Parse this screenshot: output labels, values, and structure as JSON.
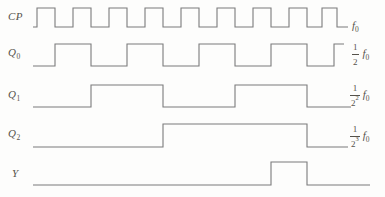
{
  "figure_type": "timing-diagram",
  "colors": {
    "background": "#fdfdfc",
    "line": "#7b7b7b",
    "text": "#55524b"
  },
  "signals": [
    {
      "id": "cp",
      "name": "CP",
      "sub": "",
      "x_start": 33,
      "x_end": 348,
      "initial_level": "low",
      "toggles": [
        37,
        55,
        73,
        91,
        109,
        127,
        145,
        163,
        181,
        199,
        217,
        235,
        253,
        271,
        289,
        307,
        322,
        337
      ]
    },
    {
      "id": "q0",
      "name": "Q",
      "sub": "0",
      "x_start": 33,
      "x_end": 344,
      "initial_level": "low",
      "toggles": [
        55,
        91,
        127,
        163,
        199,
        235,
        271,
        307,
        334
      ]
    },
    {
      "id": "q1",
      "name": "Q",
      "sub": "1",
      "x_start": 33,
      "x_end": 351,
      "initial_level": "low",
      "toggles": [
        91,
        163,
        235,
        307
      ]
    },
    {
      "id": "q2",
      "name": "Q",
      "sub": "2",
      "x_start": 33,
      "x_end": 348,
      "initial_level": "low",
      "toggles": [
        163,
        307
      ]
    },
    {
      "id": "y",
      "name": "Y",
      "sub": "",
      "x_start": 33,
      "x_end": 370,
      "initial_level": "low",
      "toggles": [
        271,
        307
      ]
    }
  ],
  "right_labels": [
    {
      "kind": "plain",
      "num": "",
      "den": "",
      "exp": "",
      "f": "f",
      "fsub": "0"
    },
    {
      "kind": "fraction",
      "num": "1",
      "den": "2",
      "exp": "",
      "f": "f",
      "fsub": "0"
    },
    {
      "kind": "fraction",
      "num": "1",
      "den": "2",
      "exp": "2",
      "f": "f",
      "fsub": "0"
    },
    {
      "kind": "fraction",
      "num": "1",
      "den": "2",
      "exp": "3",
      "f": "f",
      "fsub": "0"
    }
  ]
}
